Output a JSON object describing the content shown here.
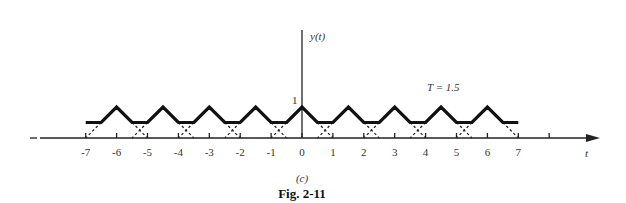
{
  "figure": {
    "y_axis_label": "y(t)",
    "x_axis_label": "t",
    "peak_label": "1",
    "period_label": "T = 1.5",
    "subfigure_label": "(c)",
    "caption": "Fig. 2-11",
    "x_ticks": [
      -7,
      -6,
      -5,
      -4,
      -3,
      -2,
      -1,
      0,
      1,
      2,
      3,
      4,
      5,
      6,
      7
    ],
    "x_tick_labels": [
      "-7",
      "-6",
      "-5",
      "-4",
      "-3",
      "-2",
      "-1",
      "0",
      "1",
      "2",
      "3",
      "4",
      "5",
      "6",
      "7"
    ],
    "extra_tick": 8,
    "colors": {
      "line": "#111111",
      "axis": "#222222"
    }
  },
  "chart_data": {
    "type": "line",
    "annotation": "T = 1.5",
    "xlabel": "t",
    "ylabel": "y(t)",
    "xlim": [
      -7,
      7
    ],
    "ylim": [
      0,
      1
    ],
    "period": 1.5,
    "peaks_t": [
      -6,
      -4.5,
      -3,
      -1.5,
      0,
      1.5,
      3,
      4.5,
      6
    ],
    "peak_value": 1,
    "flat_value": 0.5,
    "solid_waveform_points": [
      [
        -7,
        0.5
      ],
      [
        -6.5,
        0.5
      ],
      [
        -6,
        1
      ],
      [
        -5.5,
        0.5
      ],
      [
        -5,
        0.5
      ],
      [
        -4.5,
        1
      ],
      [
        -4,
        0.5
      ],
      [
        -3.5,
        0.5
      ],
      [
        -3,
        1
      ],
      [
        -2.5,
        0.5
      ],
      [
        -2,
        0.5
      ],
      [
        -1.5,
        1
      ],
      [
        -1,
        0.5
      ],
      [
        -0.5,
        0.5
      ],
      [
        0,
        1
      ],
      [
        0.5,
        0.5
      ],
      [
        1,
        0.5
      ],
      [
        1.5,
        1
      ],
      [
        2,
        0.5
      ],
      [
        2.5,
        0.5
      ],
      [
        3,
        1
      ],
      [
        3.5,
        0.5
      ],
      [
        4,
        0.5
      ],
      [
        4.5,
        1
      ],
      [
        5,
        0.5
      ],
      [
        5.5,
        0.5
      ],
      [
        6,
        1
      ],
      [
        6.5,
        0.5
      ],
      [
        7,
        0.5
      ]
    ],
    "dashed_component_tails": "each unit triangle (height 1, half-width 1) centered at kT continues dashed from 0.5 down to 0"
  }
}
